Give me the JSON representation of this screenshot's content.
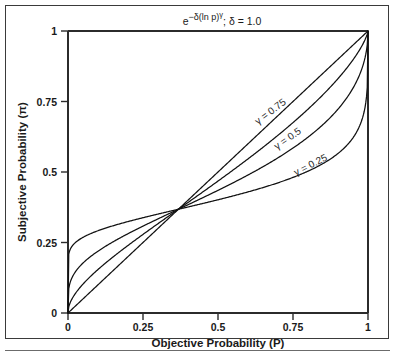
{
  "figure": {
    "plot_title": "e −δ(ln p)γ ; δ = 1.0",
    "title_parts": {
      "base": "e",
      "exp_lead": "−δ(ln p)",
      "exp_gamma": "γ",
      "tail": "; δ = 1.0"
    }
  },
  "axes": {
    "x_title": "Objective Probability (P)",
    "y_title": "Subjective Probability (π)",
    "x_ticks": [
      "0",
      "0.25",
      "0.5",
      "0.75",
      "1"
    ],
    "y_ticks": [
      "0",
      "0.25",
      "0.5",
      "0.75",
      "1"
    ]
  },
  "curve_labels": {
    "g075": "γ = 0.75",
    "g05": "γ = 0.5",
    "g025": "γ = 0.25"
  },
  "chart_data": {
    "type": "line",
    "subtitle": "",
    "xlabel": "Objective Probability (P)",
    "ylabel": "Subjective Probability (π)",
    "xlim": [
      0,
      1
    ],
    "ylim": [
      0,
      1
    ],
    "xticks": [
      0,
      0.25,
      0.5,
      0.75,
      1
    ],
    "yticks": [
      0,
      0.25,
      0.5,
      0.75,
      1
    ],
    "grid": false,
    "legend": "inline-curve-labels",
    "function": "w(p) = exp(-delta * (-ln p)^gamma), delta = 1.0",
    "fixed_point": [
      0.3679,
      0.3679
    ],
    "x": [
      0,
      0.02,
      0.05,
      0.1,
      0.15,
      0.2,
      0.25,
      0.3,
      0.3679,
      0.45,
      0.5,
      0.6,
      0.7,
      0.8,
      0.9,
      0.95,
      0.98,
      1
    ],
    "series": [
      {
        "name": "γ = 0.25",
        "gamma": 0.25,
        "values": [
          0,
          0.142,
          0.186,
          0.231,
          0.259,
          0.28,
          0.298,
          0.314,
          0.332,
          0.357,
          0.371,
          0.399,
          0.432,
          0.475,
          0.546,
          0.606,
          0.675,
          1
        ]
      },
      {
        "name": "γ = 0.5",
        "gamma": 0.5,
        "values": [
          0,
          0.134,
          0.178,
          0.222,
          0.252,
          0.275,
          0.295,
          0.313,
          0.334,
          0.365,
          0.383,
          0.42,
          0.464,
          0.52,
          0.604,
          0.667,
          0.73,
          1
        ]
      },
      {
        "name": "γ = 0.75",
        "gamma": 0.75,
        "values": [
          0,
          0.081,
          0.124,
          0.175,
          0.213,
          0.245,
          0.273,
          0.3,
          0.332,
          0.383,
          0.412,
          0.47,
          0.536,
          0.613,
          0.714,
          0.78,
          0.833,
          1
        ]
      },
      {
        "name": "γ = 1.0",
        "gamma": 1.0,
        "values": [
          0,
          0.02,
          0.05,
          0.1,
          0.15,
          0.2,
          0.25,
          0.3,
          0.3679,
          0.45,
          0.5,
          0.6,
          0.7,
          0.8,
          0.9,
          0.95,
          0.98,
          1
        ]
      }
    ]
  }
}
